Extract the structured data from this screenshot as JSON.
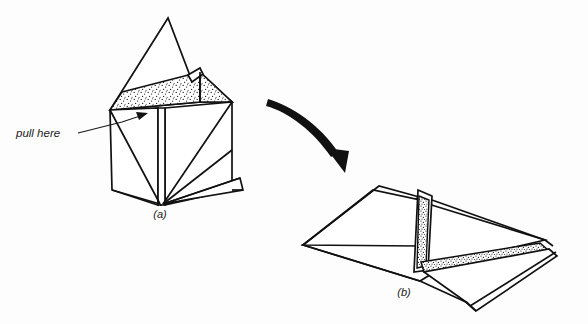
{
  "figure": {
    "type": "origami-instruction-diagram",
    "background_color": "#fdfdfd",
    "ink_color": "#111111",
    "annotation": {
      "pull_here_label": "pull here"
    },
    "captions": {
      "step_a": "(a)",
      "step_b": "(b)"
    },
    "panels": [
      {
        "id": "a",
        "caption": "(a)",
        "description": "Upright folded paper form, box-like with peaked top and open stippled flaps"
      },
      {
        "id": "b",
        "caption": "(b)",
        "description": "Flattened diamond-shaped folded paper form shown after pulling"
      }
    ],
    "motion_arrow": {
      "name": "transform-arrow",
      "direction": "down-right"
    }
  }
}
